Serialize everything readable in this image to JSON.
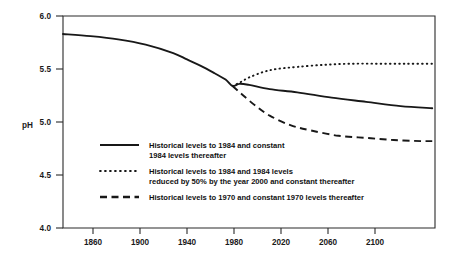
{
  "chart_data": {
    "type": "line",
    "title": "",
    "subtitle": "",
    "xlabel": "",
    "ylabel": "pH",
    "xlim": [
      1850,
      2120
    ],
    "ylim": [
      4.0,
      6.0
    ],
    "grid": false,
    "legend_position": "inside-lower-left",
    "x_ticks": [
      "1860",
      "1900",
      "1940",
      "1980",
      "2020",
      "2060",
      "2100"
    ],
    "x_tick_values": [
      1860,
      1900,
      1940,
      1980,
      2020,
      2060,
      2100
    ],
    "y_ticks": [
      "4.0",
      "4.5",
      "5.0",
      "5.5",
      "6.0"
    ],
    "y_tick_values": [
      4.0,
      4.5,
      5.0,
      5.5,
      6.0
    ],
    "series": [
      {
        "name": "Historical levels to 1984 and constant 1984 levels thereafter",
        "style": "solid",
        "x": [
          1850,
          1870,
          1890,
          1910,
          1930,
          1940,
          1950,
          1960,
          1968,
          1973,
          1978,
          1985,
          2000,
          2020,
          2045,
          2070,
          2095,
          2118
        ],
        "y": [
          5.83,
          5.81,
          5.78,
          5.73,
          5.65,
          5.59,
          5.53,
          5.46,
          5.4,
          5.34,
          5.36,
          5.35,
          5.31,
          5.28,
          5.23,
          5.19,
          5.15,
          5.13
        ]
      },
      {
        "name": "Historical levels to 1984 and 1984 levels reduced by 50% by the year 2000 and constant thereafter",
        "style": "dotted",
        "x": [
          1973,
          1978,
          1985,
          1995,
          2005,
          2020,
          2040,
          2060,
          2080,
          2100,
          2118
        ],
        "y": [
          5.34,
          5.37,
          5.42,
          5.47,
          5.5,
          5.52,
          5.54,
          5.55,
          5.55,
          5.55,
          5.55
        ]
      },
      {
        "name": "Historical levels to 1970 and constant 1970 levels thereafter",
        "style": "dashed",
        "x": [
          1973,
          1980,
          1990,
          2000,
          2015,
          2030,
          2050,
          2070,
          2090,
          2110,
          2118
        ],
        "y": [
          5.34,
          5.26,
          5.15,
          5.06,
          4.97,
          4.92,
          4.87,
          4.85,
          4.83,
          4.82,
          4.82
        ]
      }
    ]
  },
  "legend": {
    "items": [
      {
        "style": "solid",
        "line1": "Historical levels to 1984 and constant",
        "line2": "1984 levels thereafter"
      },
      {
        "style": "dotted",
        "line1": "Historical levels to 1984 and 1984 levels",
        "line2": "reduced by 50% by the year 2000 and constant thereafter"
      },
      {
        "style": "dashed",
        "line1": "Historical levels to 1970 and constant 1970 levels thereafter",
        "line2": ""
      }
    ]
  },
  "colors": {
    "line": "#181818",
    "axis": "#2b2b2b",
    "text": "#111111",
    "background": "#ffffff"
  }
}
